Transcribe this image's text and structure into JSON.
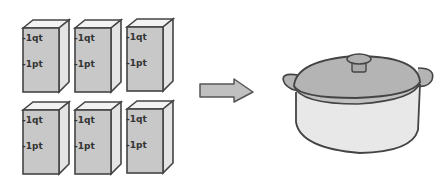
{
  "diagram": {
    "cartons": [
      {
        "marks": [
          "-1qt",
          "-1pt"
        ]
      },
      {
        "marks": [
          "-1qt",
          "-1pt"
        ]
      },
      {
        "marks": [
          "-1qt",
          "-1pt"
        ]
      },
      {
        "marks": [
          "-1qt",
          "-1pt"
        ]
      },
      {
        "marks": [
          "-1qt",
          "-1pt"
        ]
      },
      {
        "marks": [
          "-1qt",
          "-1pt"
        ]
      }
    ],
    "arrow": "right-arrow",
    "target": "cooking-pot",
    "colors": {
      "outline": "#444444",
      "carton_front": "#c8c8c8",
      "carton_side": "#e4e4e4",
      "carton_top": "#f2f2f2",
      "pot_lid": "#b4b4b4",
      "pot_body": "#e8e8e8",
      "arrow": "#c0c0c0"
    }
  }
}
